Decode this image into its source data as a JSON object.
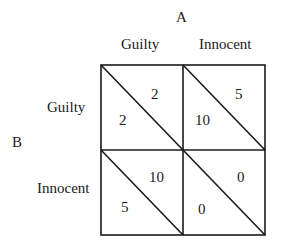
{
  "diagram": {
    "type": "payoff-matrix",
    "player_column": "A",
    "player_row": "B",
    "column_strategies": [
      "Guilty",
      "Innocent"
    ],
    "row_strategies": [
      "Guilty",
      "Innocent"
    ],
    "cells": [
      [
        {
          "row_payoff": "2",
          "col_payoff": "2"
        },
        {
          "row_payoff": "10",
          "col_payoff": "5"
        }
      ],
      [
        {
          "row_payoff": "5",
          "col_payoff": "10"
        },
        {
          "row_payoff": "0",
          "col_payoff": "0"
        }
      ]
    ],
    "line_color": "#1a1a1a"
  }
}
